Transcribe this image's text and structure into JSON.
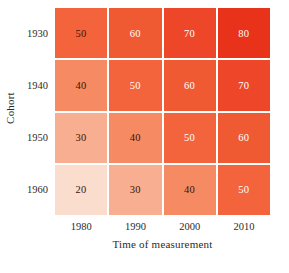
{
  "chart_data": {
    "type": "heatmap",
    "title": "",
    "xlabel": "Time of measurement",
    "ylabel": "Cohort",
    "x_categories": [
      "1980",
      "1990",
      "2000",
      "2010"
    ],
    "y_categories": [
      "1930",
      "1940",
      "1950",
      "1960"
    ],
    "grid": true,
    "legend": "none",
    "vmin": 20,
    "vmax": 80,
    "rows": [
      {
        "cohort": "1930",
        "cells": [
          {
            "value": 50,
            "label": "50",
            "color": "#F3643C",
            "text_color": "#3a1408"
          },
          {
            "value": 60,
            "label": "60",
            "color": "#F05A33",
            "text_color": "#ffffff"
          },
          {
            "value": 70,
            "label": "70",
            "color": "#ED4628",
            "text_color": "#ffffff"
          },
          {
            "value": 80,
            "label": "80",
            "color": "#E8331A",
            "text_color": "#ffffff"
          }
        ]
      },
      {
        "cohort": "1940",
        "cells": [
          {
            "value": 40,
            "label": "40",
            "color": "#F58A63",
            "text_color": "#3a1408"
          },
          {
            "value": 50,
            "label": "50",
            "color": "#F3643C",
            "text_color": "#ffffff"
          },
          {
            "value": 60,
            "label": "60",
            "color": "#F05A33",
            "text_color": "#ffffff"
          },
          {
            "value": 70,
            "label": "70",
            "color": "#ED4628",
            "text_color": "#ffffff"
          }
        ]
      },
      {
        "cohort": "1950",
        "cells": [
          {
            "value": 30,
            "label": "30",
            "color": "#F8AE90",
            "text_color": "#3a1408"
          },
          {
            "value": 40,
            "label": "40",
            "color": "#F58A63",
            "text_color": "#3a1408"
          },
          {
            "value": 50,
            "label": "50",
            "color": "#F3643C",
            "text_color": "#ffffff"
          },
          {
            "value": 60,
            "label": "60",
            "color": "#F05A33",
            "text_color": "#ffffff"
          }
        ]
      },
      {
        "cohort": "1960",
        "cells": [
          {
            "value": 20,
            "label": "20",
            "color": "#FBDDCE",
            "text_color": "#3a1408"
          },
          {
            "value": 30,
            "label": "30",
            "color": "#F8AE90",
            "text_color": "#3a1408"
          },
          {
            "value": 40,
            "label": "40",
            "color": "#F58A63",
            "text_color": "#3a1408"
          },
          {
            "value": 50,
            "label": "50",
            "color": "#F3643C",
            "text_color": "#ffffff"
          }
        ]
      }
    ]
  },
  "axes": {
    "y_title": "Cohort",
    "x_title": "Time of measurement",
    "y_ticks": [
      "1930",
      "1940",
      "1950",
      "1960"
    ],
    "x_ticks": [
      "1980",
      "1990",
      "2000",
      "2010"
    ]
  },
  "style": {
    "background": "#ffffff",
    "gridline_color": "#ffffff",
    "tick_text_color": "#2b2b2b"
  }
}
